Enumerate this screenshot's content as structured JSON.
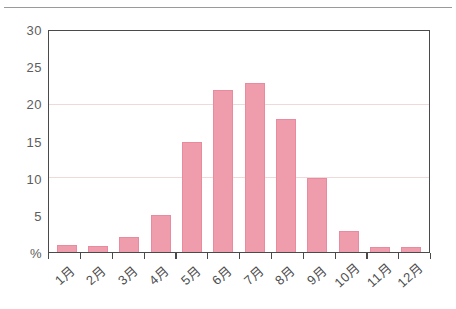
{
  "chart_data": {
    "type": "bar",
    "title": "",
    "xlabel": "",
    "ylabel": "%",
    "categories": [
      "1月",
      "2月",
      "3月",
      "4月",
      "5月",
      "6月",
      "7月",
      "8月",
      "9月",
      "10月",
      "11月",
      "12月"
    ],
    "values": [
      1,
      0.8,
      2,
      5,
      15,
      22,
      23,
      18,
      10,
      2.8,
      0.7,
      0.7
    ],
    "series": [
      {
        "name": "",
        "values": [
          1,
          0.8,
          2,
          5,
          15,
          22,
          23,
          18,
          10,
          2.8,
          0.7,
          0.7
        ]
      }
    ],
    "ylim": [
      0,
      30
    ],
    "y_ticks": [
      0,
      5,
      10,
      15,
      20,
      25,
      30
    ],
    "y_tick_labels": [
      "%",
      "5",
      "10",
      "15",
      "20",
      "25",
      "30"
    ],
    "gridlines": [
      10,
      20
    ],
    "grid": true,
    "legend": null,
    "legend_position": "none",
    "bar_color": "#ef9dac",
    "bar_edge_color": "#e98b9d",
    "axis_color": "#4a4a4a",
    "grid_color": "#efdada",
    "tick_label_color": "#5d5d5d"
  }
}
